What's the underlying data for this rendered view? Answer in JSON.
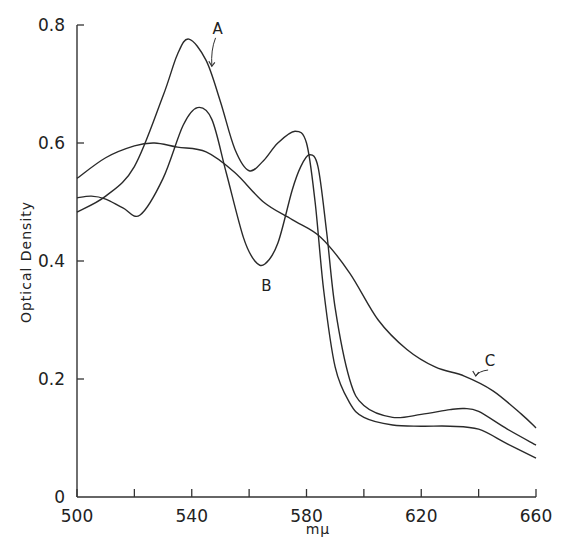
{
  "chart_data": {
    "type": "line",
    "title": "",
    "xlabel": "mμ",
    "ylabel": "Optical Density",
    "xlim": [
      500,
      660
    ],
    "ylim": [
      0,
      0.8
    ],
    "x_ticks": [
      500,
      520,
      540,
      560,
      580,
      600,
      620,
      640,
      660
    ],
    "x_tick_labels": [
      "500",
      "",
      "540",
      "",
      "580",
      "",
      "620",
      "",
      "660"
    ],
    "y_ticks": [
      0,
      0.2,
      0.4,
      0.6,
      0.8
    ],
    "y_tick_labels": [
      "0",
      "0.2",
      "0.4",
      "0.6",
      "0.8"
    ],
    "grid": false,
    "legend": "none (curves labeled directly)",
    "series": [
      {
        "name": "A",
        "x": [
          500,
          510,
          520,
          530,
          535,
          539,
          545,
          550,
          555,
          560,
          565,
          570,
          576,
          580,
          583,
          586,
          590,
          595,
          600,
          610,
          620,
          630,
          640,
          650,
          660
        ],
        "y": [
          0.483,
          0.51,
          0.56,
          0.68,
          0.75,
          0.776,
          0.74,
          0.67,
          0.59,
          0.553,
          0.57,
          0.6,
          0.62,
          0.6,
          0.5,
          0.35,
          0.22,
          0.16,
          0.135,
          0.122,
          0.12,
          0.12,
          0.115,
          0.09,
          0.066
        ]
      },
      {
        "name": "B",
        "x": [
          500,
          505,
          510,
          516,
          522,
          530,
          537,
          542,
          547,
          552,
          558,
          562,
          565.5,
          570,
          575,
          578,
          581,
          584,
          587,
          590,
          595,
          600,
          610,
          620,
          630,
          635,
          640,
          650,
          660
        ],
        "y": [
          0.507,
          0.51,
          0.505,
          0.49,
          0.478,
          0.54,
          0.63,
          0.66,
          0.64,
          0.55,
          0.44,
          0.4,
          0.395,
          0.43,
          0.52,
          0.56,
          0.58,
          0.56,
          0.45,
          0.32,
          0.2,
          0.155,
          0.135,
          0.14,
          0.148,
          0.15,
          0.145,
          0.115,
          0.088
        ]
      },
      {
        "name": "C",
        "x": [
          500,
          510,
          520,
          527,
          535,
          545,
          555,
          565,
          575,
          585,
          595,
          605,
          615,
          625,
          635,
          645,
          655,
          660
        ],
        "y": [
          0.54,
          0.575,
          0.595,
          0.6,
          0.593,
          0.585,
          0.55,
          0.5,
          0.47,
          0.44,
          0.38,
          0.3,
          0.25,
          0.22,
          0.205,
          0.18,
          0.14,
          0.117
        ]
      }
    ],
    "annotations": [
      {
        "text": "A",
        "x": 549,
        "y": 0.785,
        "arrow_to": [
          547,
          0.73
        ]
      },
      {
        "text": "B",
        "x": 566,
        "y": 0.35
      },
      {
        "text": "C",
        "x": 644,
        "y": 0.222,
        "arrow_to": [
          639,
          0.205
        ]
      }
    ]
  }
}
